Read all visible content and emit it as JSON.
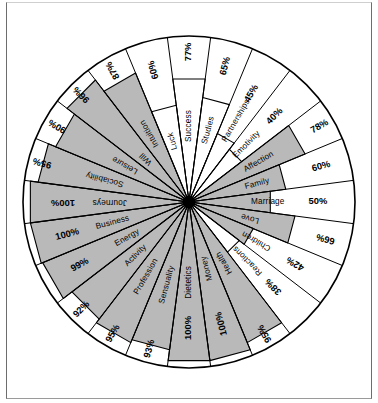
{
  "chart_data": {
    "type": "pie",
    "title": "",
    "subtitle": "",
    "xlabel": "",
    "ylabel": "",
    "value_unit": "%",
    "value_range": [
      0,
      100
    ],
    "grid": false,
    "legend_position": "none",
    "layout": "radial wheel / polar bar chart, 24 equal-angle sectors, radius proportional to percentage, starting at 12 o'clock and proceeding clockwise",
    "colors": {
      "filled": "#b9b9b9",
      "empty": "#ffffff",
      "stroke": "#000000",
      "hub": "#000000",
      "frame": "#6d6d6d"
    },
    "fill_threshold_note": "sectors at or above ~78% are shaded gray; lower sectors are left white",
    "categories": [
      "Success",
      "Studies",
      "Partnerships",
      "Emotivity",
      "Affection",
      "Family",
      "Marriage",
      "Love",
      "Children",
      "Reactions",
      "Health",
      "Money",
      "Dietetics",
      "Sensuality",
      "Profession",
      "Activity",
      "Energy",
      "Business",
      "Journeys",
      "Sociability",
      "Leisure",
      "Will",
      "Intuition",
      "Luck"
    ],
    "values": [
      77,
      65,
      45,
      40,
      78,
      60,
      50,
      66,
      42,
      38,
      95,
      100,
      100,
      93,
      95,
      92,
      99,
      100,
      100,
      95,
      90,
      96,
      87,
      60
    ],
    "value_labels": [
      "77%",
      "65%",
      "45%",
      "40%",
      "78%",
      "60%",
      "50%",
      "66%",
      "42%",
      "38%",
      "95%",
      "100%",
      "100%",
      "93%",
      "95%",
      "92%",
      "99%",
      "100%",
      "100%",
      "95%",
      "90%",
      "96%",
      "87%",
      "60%"
    ],
    "sectors": [
      {
        "label": "Success",
        "value": 77,
        "value_label": "77%",
        "filled": false
      },
      {
        "label": "Studies",
        "value": 65,
        "value_label": "65%",
        "filled": false
      },
      {
        "label": "Partnerships",
        "value": 45,
        "value_label": "45%",
        "filled": false
      },
      {
        "label": "Emotivity",
        "value": 40,
        "value_label": "40%",
        "filled": false
      },
      {
        "label": "Affection",
        "value": 78,
        "value_label": "78%",
        "filled": true
      },
      {
        "label": "Family",
        "value": 60,
        "value_label": "60%",
        "filled": true
      },
      {
        "label": "Marriage",
        "value": 50,
        "value_label": "50%",
        "filled": true
      },
      {
        "label": "Love",
        "value": 66,
        "value_label": "66%",
        "filled": true
      },
      {
        "label": "Children",
        "value": 42,
        "value_label": "42%",
        "filled": true
      },
      {
        "label": "Reactions",
        "value": 38,
        "value_label": "38%",
        "filled": false
      },
      {
        "label": "Health",
        "value": 95,
        "value_label": "95%",
        "filled": true
      },
      {
        "label": "Money",
        "value": 100,
        "value_label": "100%",
        "filled": true
      },
      {
        "label": "Dietetics",
        "value": 100,
        "value_label": "100%",
        "filled": true
      },
      {
        "label": "Sensuality",
        "value": 93,
        "value_label": "93%",
        "filled": true
      },
      {
        "label": "Profession",
        "value": 95,
        "value_label": "95%",
        "filled": true
      },
      {
        "label": "Activity",
        "value": 92,
        "value_label": "92%",
        "filled": true
      },
      {
        "label": "Energy",
        "value": 99,
        "value_label": "99%",
        "filled": true
      },
      {
        "label": "Business",
        "value": 100,
        "value_label": "100%",
        "filled": true
      },
      {
        "label": "Journeys",
        "value": 100,
        "value_label": "100%",
        "filled": true
      },
      {
        "label": "Sociability",
        "value": 95,
        "value_label": "95%",
        "filled": true
      },
      {
        "label": "Leisure",
        "value": 90,
        "value_label": "90%",
        "filled": true
      },
      {
        "label": "Will",
        "value": 96,
        "value_label": "96%",
        "filled": true
      },
      {
        "label": "Intuition",
        "value": 87,
        "value_label": "87%",
        "filled": true
      },
      {
        "label": "Luck",
        "value": 60,
        "value_label": "60%",
        "filled": false
      }
    ]
  }
}
